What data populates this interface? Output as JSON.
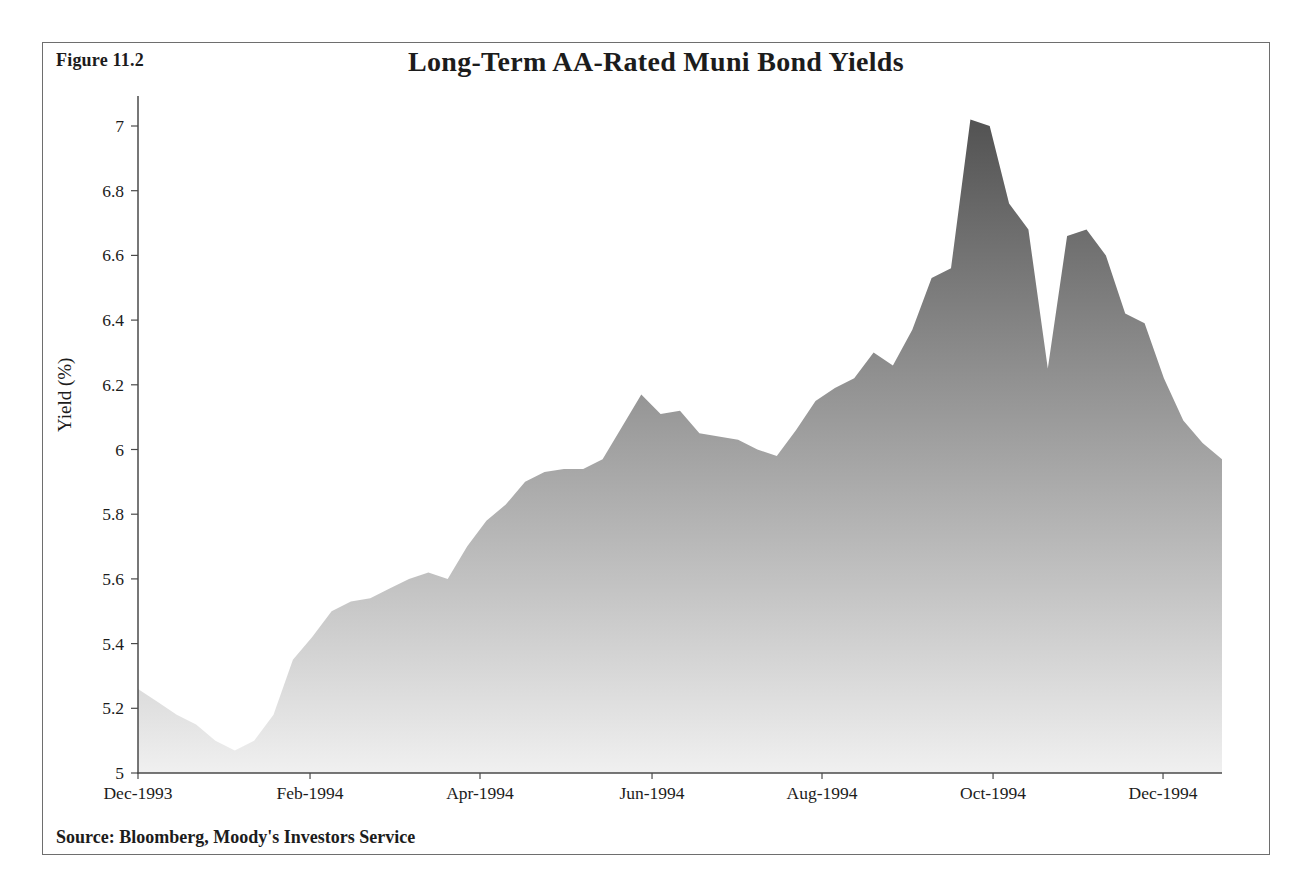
{
  "figure": {
    "label": "Figure 11.2",
    "title": "Long-Term AA-Rated Muni Bond Yields",
    "y_axis_label": "Yield (%)",
    "source": "Source: Bloomberg, Moody's Investors Service"
  },
  "chart_data": {
    "type": "area",
    "title": "Long-Term AA-Rated Muni Bond Yields",
    "xlabel": "",
    "ylabel": "Yield (%)",
    "ylim": [
      5,
      7
    ],
    "ytick_step": 0.2,
    "ytick_labels": [
      "5",
      "5.2",
      "5.4",
      "5.6",
      "5.8",
      "6",
      "6.2",
      "6.4",
      "6.6",
      "6.8",
      "7"
    ],
    "grid": false,
    "legend": false,
    "x_unit": "weekly observations, Dec-1993 through Dec-1994",
    "x_ticks": [
      {
        "label": "Dec-1993",
        "frac": 0.0
      },
      {
        "label": "Feb-1994",
        "frac": 0.1587
      },
      {
        "label": "Apr-1994",
        "frac": 0.3155
      },
      {
        "label": "Jun-1994",
        "frac": 0.4742
      },
      {
        "label": "Aug-1994",
        "frac": 0.631
      },
      {
        "label": "Oct-1994",
        "frac": 0.7888
      },
      {
        "label": "Dec-1994",
        "frac": 0.9456
      }
    ],
    "values": [
      5.26,
      5.22,
      5.18,
      5.15,
      5.1,
      5.07,
      5.1,
      5.18,
      5.35,
      5.42,
      5.5,
      5.53,
      5.54,
      5.57,
      5.6,
      5.62,
      5.6,
      5.7,
      5.78,
      5.83,
      5.9,
      5.93,
      5.94,
      5.94,
      5.97,
      6.07,
      6.17,
      6.11,
      6.12,
      6.05,
      6.04,
      6.03,
      6.0,
      5.98,
      6.06,
      6.15,
      6.19,
      6.22,
      6.3,
      6.26,
      6.37,
      6.53,
      6.56,
      7.02,
      7.0,
      6.76,
      6.68,
      6.25,
      6.66,
      6.68,
      6.6,
      6.42,
      6.39,
      6.22,
      6.09,
      6.02,
      5.97
    ],
    "colors": {
      "fill_top": "#545454",
      "fill_bottom": "#f0f0f0",
      "axis": "#4a4a4a",
      "text": "#1c1c1c"
    }
  }
}
